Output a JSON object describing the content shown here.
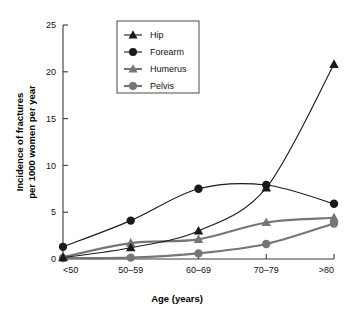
{
  "chart_data": {
    "type": "line",
    "title": "",
    "xlabel": "Age (years)",
    "ylabel": "Incidence of fractures per 1000 women per year",
    "ylabel_line1": "Incidence of fractures",
    "ylabel_line2": "per 1000 women per year",
    "categories": [
      "<50",
      "50–59",
      "60–69",
      "70–79",
      ">80"
    ],
    "ylim": [
      0,
      25
    ],
    "xlim": [
      0,
      4
    ],
    "yticks": [
      0,
      5,
      10,
      15,
      20,
      25
    ],
    "ytick_labels": [
      "0",
      "5",
      "10",
      "15",
      "20",
      "25"
    ],
    "grid": false,
    "legend_position": "top-center",
    "series": [
      {
        "name": "Hip",
        "marker": "triangle",
        "color": "#1a1a1a",
        "values": [
          0.15,
          1.2,
          3.0,
          7.6,
          20.8
        ]
      },
      {
        "name": "Forearm",
        "marker": "circle",
        "color": "#1a1a1a",
        "values": [
          1.3,
          4.1,
          7.5,
          7.9,
          5.9
        ]
      },
      {
        "name": "Humerus",
        "marker": "triangle",
        "color": "#767676",
        "values": [
          0.2,
          1.7,
          2.1,
          3.9,
          4.4
        ]
      },
      {
        "name": "Pelvis",
        "marker": "circle",
        "color": "#767676",
        "values": [
          0.1,
          0.15,
          0.6,
          1.6,
          3.8
        ]
      }
    ]
  },
  "legend": {
    "entries": [
      {
        "label": "Hip"
      },
      {
        "label": "Forearm"
      },
      {
        "label": "Humerus"
      },
      {
        "label": "Pelvis"
      }
    ]
  },
  "colors": {
    "black_series": "#1a1a1a",
    "gray_series": "#767676",
    "axis": "#3a3a3a",
    "background": "#ffffff"
  }
}
